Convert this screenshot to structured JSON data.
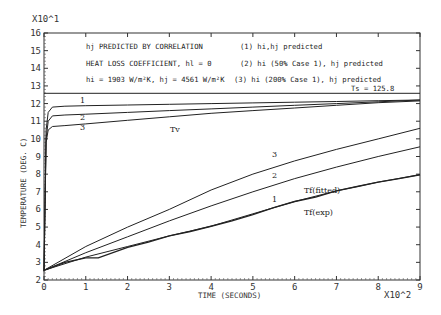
{
  "chart_data": {
    "type": "line",
    "title": "",
    "xlabel": "TIME (SECONDS)",
    "ylabel": "TEMPERATURE (DEG. C)",
    "x_multiplier": "X10^2",
    "y_multiplier": "X10^1",
    "xlim": [
      0,
      9
    ],
    "ylim": [
      2,
      16
    ],
    "x_ticks": [
      "0",
      "1",
      "2",
      "3",
      "4",
      "5",
      "6",
      "7",
      "8",
      "9"
    ],
    "y_ticks": [
      "2",
      "3",
      "4",
      "5",
      "6",
      "7",
      "8",
      "9",
      "10",
      "11",
      "12",
      "13",
      "14",
      "15",
      "16"
    ],
    "grid": false,
    "annotations": {
      "line1": "hj PREDICTED BY CORRELATION",
      "line2": "HEAT LOSS COEFFICIENT, hl = 0",
      "line3": "hi = 1903 W/m²K, hj = 4561 W/m²K",
      "case1": "(1) hi,hj predicted",
      "case2": "(2) hi (50% Case 1), hj predicted",
      "case3": "(3) hi (200% Case 1), hj predicted",
      "ts_label": "Ts = 125.8",
      "tv_label": "Tv",
      "tf_fitted_label": "Tf(fitted)",
      "tf_exp_label": "Tf(exp)",
      "curve_labels": [
        "1",
        "2",
        "3"
      ]
    },
    "series": [
      {
        "name": "Ts",
        "x": [
          0,
          9
        ],
        "y": [
          12.58,
          12.58
        ]
      },
      {
        "name": "Tv (1)",
        "x": [
          0,
          0.05,
          0.1,
          0.2,
          0.5,
          1,
          2,
          3,
          4,
          5,
          6,
          7,
          8,
          9
        ],
        "y": [
          2.5,
          10.5,
          11.5,
          11.8,
          11.85,
          11.88,
          11.92,
          11.96,
          12.0,
          12.04,
          12.08,
          12.12,
          12.16,
          12.2
        ]
      },
      {
        "name": "Tv (2)",
        "x": [
          0,
          0.05,
          0.1,
          0.2,
          0.5,
          1,
          2,
          3,
          4,
          5,
          6,
          7,
          8,
          9
        ],
        "y": [
          2.5,
          10.0,
          11.0,
          11.3,
          11.35,
          11.4,
          11.5,
          11.6,
          11.7,
          11.8,
          11.9,
          12.0,
          12.1,
          12.2
        ]
      },
      {
        "name": "Tv (3)",
        "x": [
          0,
          0.05,
          0.1,
          0.2,
          0.5,
          1,
          2,
          3,
          4,
          5,
          6,
          7,
          8,
          9
        ],
        "y": [
          2.5,
          9.8,
          10.5,
          10.7,
          10.75,
          10.85,
          11.05,
          11.25,
          11.45,
          11.6,
          11.75,
          11.9,
          12.05,
          12.15
        ]
      },
      {
        "name": "Tf (3)",
        "x": [
          0,
          1,
          2,
          3,
          4,
          5,
          6,
          7,
          8,
          9
        ],
        "y": [
          2.55,
          3.9,
          5.0,
          6.0,
          7.1,
          8.0,
          8.75,
          9.4,
          10.0,
          10.6
        ]
      },
      {
        "name": "Tf (2)",
        "x": [
          0,
          1,
          2,
          3,
          4,
          5,
          6,
          7,
          8,
          9
        ],
        "y": [
          2.55,
          3.55,
          4.45,
          5.35,
          6.2,
          7.0,
          7.75,
          8.4,
          9.0,
          9.55
        ]
      },
      {
        "name": "Tf (1) / Tf(fitted)",
        "x": [
          0,
          1,
          2,
          3,
          4,
          5,
          6,
          7,
          8,
          9
        ],
        "y": [
          2.55,
          3.3,
          3.9,
          4.5,
          5.05,
          5.75,
          6.45,
          7.05,
          7.55,
          7.97
        ]
      },
      {
        "name": "Tf (exp)",
        "x": [
          0,
          0.5,
          1,
          1.3,
          2,
          2.5,
          3,
          3.5,
          4,
          4.5,
          5,
          5.5,
          6,
          6.5,
          7,
          7.5,
          8,
          8.5,
          9
        ],
        "y": [
          2.55,
          3.0,
          3.25,
          3.25,
          3.85,
          4.15,
          4.5,
          4.75,
          5.05,
          5.35,
          5.7,
          6.1,
          6.45,
          6.7,
          7.05,
          7.3,
          7.55,
          7.75,
          7.97
        ]
      }
    ]
  }
}
